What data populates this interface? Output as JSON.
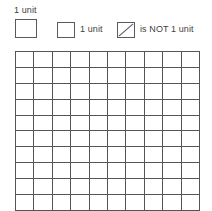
{
  "legend": {
    "items": [
      {
        "id": "unit-square-example",
        "label": "1 unit",
        "icon": "empty-square-icon",
        "label_position": "above"
      },
      {
        "id": "unit-square",
        "label": "1 unit",
        "icon": "empty-square-icon",
        "label_position": "right"
      },
      {
        "id": "not-unit-square",
        "label": "is NOT 1 unit",
        "icon": "square-with-diagonal-icon",
        "label_position": "right"
      }
    ]
  },
  "grid": {
    "rows": 10,
    "columns": 10,
    "total_cells": 100,
    "line_color": "#555555",
    "cell_fill": "#ffffff",
    "filled_cells": []
  },
  "colors": {
    "text": "#3f3f3f",
    "outline": "#5a5a5a",
    "grid_line": "#555555",
    "background": "#ffffff"
  }
}
